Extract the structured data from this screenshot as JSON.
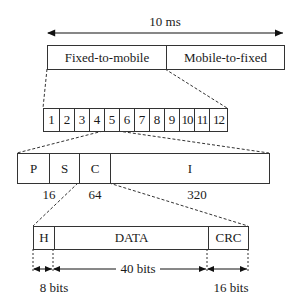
{
  "frame": {
    "duration_label": "10 ms",
    "halves": [
      "Fixed-to-mobile",
      "Mobile-to-fixed"
    ]
  },
  "slots": {
    "labels": [
      "1",
      "2",
      "3",
      "4",
      "5",
      "6",
      "7",
      "8",
      "9",
      "10",
      "11",
      "12"
    ],
    "highlighted": "5"
  },
  "slot_fields": {
    "fields": [
      "P",
      "S",
      "C",
      "I"
    ],
    "sizes": [
      "16",
      "64",
      "320"
    ]
  },
  "packet": {
    "fields": [
      "H",
      "DATA",
      "CRC"
    ],
    "sizes": {
      "header": "8 bits",
      "data": "40 bits",
      "crc": "16 bits"
    }
  }
}
